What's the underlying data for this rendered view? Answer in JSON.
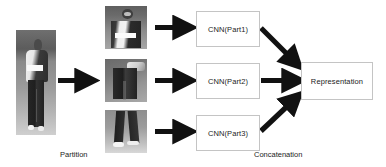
{
  "figure": {
    "type": "pipeline-diagram",
    "background_color": "#ffffff",
    "ink_color": "#111111",
    "box_border_color": "#c4c4c4"
  },
  "images": {
    "full_body": {
      "name": "full-body-pedestrian-image",
      "alt": "grayscale full body pedestrian photo"
    },
    "part1": {
      "name": "part1-upper-body-crop",
      "alt": "grayscale crop of head and torso"
    },
    "part2": {
      "name": "part2-mid-body-crop",
      "alt": "grayscale crop of waist and thighs"
    },
    "part3": {
      "name": "part3-lower-body-crop",
      "alt": "grayscale crop of legs and shoes"
    }
  },
  "boxes": {
    "cnn_part1": "CNN(Part1)",
    "cnn_part2": "CNN(Part2)",
    "cnn_part3": "CNN(Part3)",
    "representation": "Representation"
  },
  "captions": {
    "partition": "Partition",
    "concatenation": "Concatenation"
  },
  "arrows": [
    {
      "name": "arrow-full-to-parts",
      "from": "full-body-pedestrian-image",
      "to": "part2-mid-body-crop",
      "direction": "right"
    },
    {
      "name": "arrow-part1-to-cnn1",
      "from": "part1-upper-body-crop",
      "to": "CNN(Part1)",
      "direction": "right"
    },
    {
      "name": "arrow-part2-to-cnn2",
      "from": "part2-mid-body-crop",
      "to": "CNN(Part2)",
      "direction": "right"
    },
    {
      "name": "arrow-part3-to-cnn3",
      "from": "part3-lower-body-crop",
      "to": "CNN(Part3)",
      "direction": "right"
    },
    {
      "name": "arrow-cnn1-to-representation",
      "from": "CNN(Part1)",
      "to": "Representation",
      "direction": "down-right"
    },
    {
      "name": "arrow-cnn2-to-representation",
      "from": "CNN(Part2)",
      "to": "Representation",
      "direction": "right"
    },
    {
      "name": "arrow-cnn3-to-representation",
      "from": "CNN(Part3)",
      "to": "Representation",
      "direction": "up-right"
    }
  ]
}
